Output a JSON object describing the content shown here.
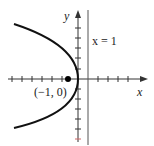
{
  "figure": {
    "equation_curve": "parabola opening left, vertex at origin",
    "axis_x_label": "x",
    "axis_y_label": "y",
    "line_label": "x = 1",
    "point_label": "(−1, 0)",
    "colors": {
      "axes": "#333333",
      "curve": "#111111",
      "line": "#555555",
      "point": "#000000"
    }
  }
}
